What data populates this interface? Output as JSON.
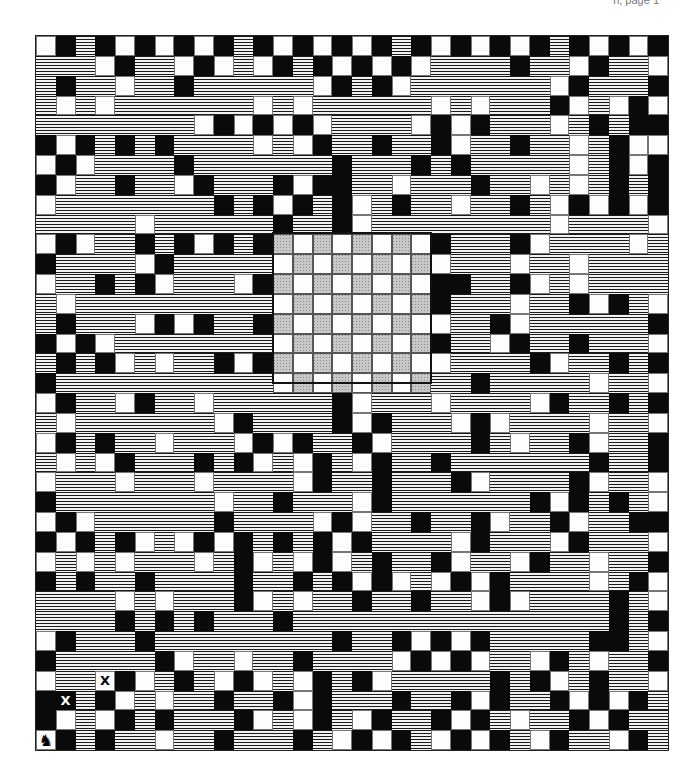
{
  "header": {
    "text": "n, page 1"
  },
  "board": {
    "columns": 32,
    "rows": 36,
    "legend": {
      "W": "white square",
      "B": "black square",
      "H": "wavy water/hatch",
      "G": "chessboard gray square",
      "C": "chessboard white square"
    },
    "grid": [
      "WBHBWBWBWBHBWBWBWBHBWBWBWBHBWBWB",
      "HHHWBHHWBWHWBHBWBWBWHHHHBHHWBHHW",
      "HBHHWHHBHHHHHHWBHBWHHHHHHHWBHHHB",
      "HWHWHHHHHHHWHWHHHHHHWHWHHHBWHWBW",
      "HHHHHHHHWBWBWBWHHHHWBWBHHHWHBHBB",
      "BWBHBHBHHHHWHWBHHBHHBWHHBHHWHBWW",
      "WBWHHHHBHHHHHHHBHHHBHBHHHHHWHBWB",
      "BWHHBHHWBHHHBWBBHHWHHHBHHWHWHBHB",
      "WHHHHHHHHBHBWBHBWHBHHWHHBHWBWBWB",
      "HHHHHWHHHHHHBHHBWHHHHHHHHHWHHHHW",
      "WBWHHBHBWBHBGCGCGCGCBHHHBWHHHHWH",
      "BHHHHWBHHHHHCGCGCGCGWHHHWHHWHHHH",
      "WHHBHBWHHHWBGCGCGCGCBBHHBWHWHHHH",
      "HWHHHHHHHHHHCGCGCGCGBHHHWHHBWBHW",
      "HBHHHWBWBHHBGCGCGCGCWHHBWHHHHHHB",
      "BWBWHHHHHHHHCGCGCGCGBHHWBHHBHHHW",
      "HBHBWHWHHBWBGCGCGCGCWHHHHBWHHBHB",
      "BHHHHHHHHHHHCGCGCGCGHHBHHHHHWHHW",
      "WBHHWBHHWHHHHHHBWHHHWHHHHWBHHBHB",
      "HWHHHHHHHWBHHHHBWBHHHWBWHHHHWHHW",
      "WBHBHHWHHHWBWBHHBWHHHHBHWHHBWHHB",
      "HWHWBHHHBHBWHWBHWBHHBHHHHHHHBHHB",
      "WHHHWHHHWHHHHWBHHBHHHBWHHHHBWHHW",
      "BHHHHHHHHWHHBHHHWBHHHHHHHBWBHBHW",
      "WBWHHHHHHBHHHHWBWHHBHHBWHHBWHHBB",
      "BWBHBWHWBWBHBHBWBHHHHWBHHHWBHHHW",
      "WHWHWHHHWHBWHWBWHBHHBWHHWBHHWHHB",
      "BHBHHBHHHHBHHBHBWBWHWBWBHHHHWHBW",
      "HHHHWHWHHHBWHWHHBHHBHHWBWHHHHBHW",
      "HHHHBHBHBHHHBHHHHHHHHHHHHHHHHBHB",
      "WBHHHBHHHHHHHHHBHHBWBWBHHHHHBBHW",
      "BHHHHHBWHHWHHBHHHHWBWBWHHWBHWHHB",
      "WHHWBWHBHWBWHWBHBWHHHHHBHBWHBHHW",
      "BBHBWHWHHBHHBWBHHHBHHBWBHHBWBWBH",
      "BWHWBHBHHHBWHWBHWBHHBWBHWHHBWBHH",
      "WBHBHHWHHBHHHBHWBWBHWBWBHWBHHWBH"
    ],
    "markers": [
      {
        "row": 33,
        "col": 1,
        "label": "X",
        "on": "black"
      },
      {
        "row": 32,
        "col": 3,
        "label": "X",
        "on": "white"
      },
      {
        "row": 35,
        "col": 0,
        "label": "♞",
        "name": "knight"
      }
    ],
    "chessboard": {
      "row": 10,
      "col": 12,
      "size": 8
    }
  }
}
